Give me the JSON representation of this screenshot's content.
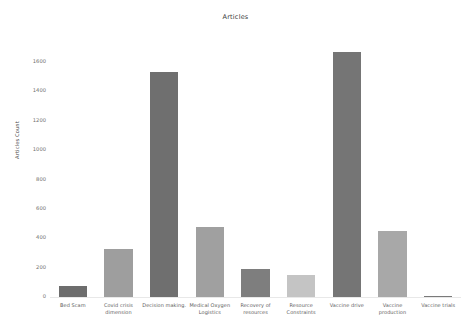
{
  "chart_data": {
    "type": "bar",
    "title": "Articles",
    "xlabel": "",
    "ylabel": "Articles Count",
    "categories": [
      "Bed Scam",
      "Covid crisis dimension",
      "Decision making.",
      "Medical Oxygen Logistics",
      "Recovery of resources",
      "Resource Constraints",
      "Vaccine drive",
      "Vaccine production",
      "Vaccine trials"
    ],
    "values": [
      75,
      330,
      1530,
      475,
      190,
      150,
      1665,
      450,
      10
    ],
    "bar_colors": [
      "#6d6d6d",
      "#9e9e9e",
      "#6f6f6f",
      "#a0a0a0",
      "#7e7e7e",
      "#c4c4c4",
      "#757575",
      "#a8a8a8",
      "#7a7a7a"
    ],
    "ylim": [
      0,
      1750
    ],
    "yticks": [
      0,
      200,
      400,
      600,
      800,
      1000,
      1200,
      1400,
      1600
    ],
    "ytick_labels": [
      "0",
      "200",
      "400",
      "600",
      "800",
      "1000",
      "1200",
      "1400",
      "1600"
    ],
    "grid": false,
    "legend": "none"
  }
}
